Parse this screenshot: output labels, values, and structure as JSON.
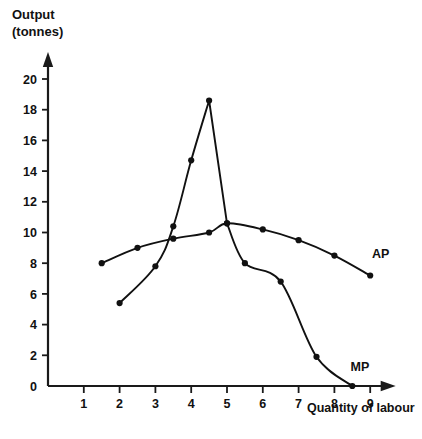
{
  "chart_data": {
    "type": "line",
    "title": "",
    "ylabel_line1": "Output",
    "ylabel_line2": "(tonnes)",
    "xlabel": "Quantity of labour",
    "xlim": [
      0,
      9.6
    ],
    "ylim": [
      0,
      21.5
    ],
    "xticks": [
      1,
      2,
      3,
      4,
      5,
      6,
      7,
      8,
      9
    ],
    "xtick_labels": [
      "1",
      "2",
      "3",
      "4",
      "5",
      "6",
      "7",
      "8",
      "9"
    ],
    "yticks": [
      0,
      2,
      4,
      6,
      8,
      10,
      12,
      14,
      16,
      18,
      20
    ],
    "ytick_labels": [
      "0",
      "2",
      "4",
      "6",
      "8",
      "10",
      "12",
      "14",
      "16",
      "18",
      "20"
    ],
    "grid": false,
    "legend_position": "inline-end-of-curve",
    "series": [
      {
        "name": "MP",
        "label": "MP",
        "label_text": "MP",
        "color": "#111111",
        "marker": "filled-circle",
        "x": [
          2.0,
          3.0,
          3.5,
          4.0,
          4.5,
          5.0,
          5.5,
          6.5,
          7.5,
          8.5
        ],
        "y": [
          5.4,
          7.8,
          10.4,
          14.7,
          18.6,
          10.6,
          8.0,
          6.8,
          1.9,
          0.0
        ],
        "label_x": 8.45,
        "label_y": 0.95
      },
      {
        "name": "AP",
        "label": "AP",
        "label_text": "AP",
        "color": "#111111",
        "marker": "filled-circle",
        "x": [
          1.5,
          2.5,
          3.5,
          4.5,
          5.0,
          6.0,
          7.0,
          8.0,
          9.0
        ],
        "y": [
          8.0,
          9.0,
          9.6,
          10.0,
          10.6,
          10.2,
          9.5,
          8.5,
          7.2
        ],
        "label_x": 9.05,
        "label_y": 8.35
      }
    ],
    "annotations": [
      {
        "text": "AP",
        "x": 9.05,
        "y": 8.35
      },
      {
        "text": "MP",
        "x": 8.45,
        "y": 0.95
      }
    ]
  }
}
